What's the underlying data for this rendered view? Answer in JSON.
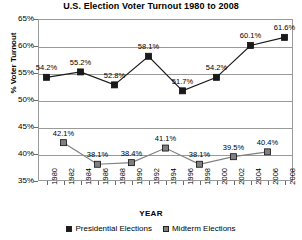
{
  "chart_data": {
    "type": "line",
    "title": "U.S. Election Voter Turnout 1980 to 2008",
    "xlabel": "YEAR",
    "ylabel": "% Voter Turnout",
    "ylim": [
      35,
      65
    ],
    "ytick_labels": [
      "65%",
      "60%",
      "55%",
      "50%",
      "45%",
      "40%",
      "35%"
    ],
    "ytick_values": [
      65,
      60,
      55,
      50,
      45,
      40,
      35
    ],
    "grid": "horizontal",
    "legend_position": "bottom-center",
    "x": [
      1980,
      1982,
      1984,
      1986,
      1988,
      1990,
      1992,
      1994,
      1996,
      1998,
      2000,
      2002,
      2004,
      2006,
      2008
    ],
    "xtick_labels": [
      "1980",
      "1982",
      "1984",
      "1986",
      "1988",
      "1990",
      "1992",
      "1994",
      "1996",
      "1998",
      "2000",
      "2002",
      "2004",
      "2006",
      "2008"
    ],
    "series": [
      {
        "name": "Presidential Elections",
        "color": "#1a1a1a",
        "marker": "square-filled-black",
        "points": [
          {
            "x": 1980,
            "y": 54.2,
            "label": "54.2%"
          },
          {
            "x": 1984,
            "y": 55.2,
            "label": "55.2%"
          },
          {
            "x": 1988,
            "y": 52.8,
            "label": "52.8%"
          },
          {
            "x": 1992,
            "y": 58.1,
            "label": "58.1%"
          },
          {
            "x": 1996,
            "y": 51.7,
            "label": "51.7%"
          },
          {
            "x": 2000,
            "y": 54.2,
            "label": "54.2%"
          },
          {
            "x": 2004,
            "y": 60.1,
            "label": "60.1%"
          },
          {
            "x": 2008,
            "y": 61.6,
            "label": "61.6%"
          }
        ]
      },
      {
        "name": "Midterm Elections",
        "color": "#808080",
        "marker": "square-filled-gray",
        "points": [
          {
            "x": 1982,
            "y": 42.1,
            "label": "42.1%"
          },
          {
            "x": 1986,
            "y": 38.1,
            "label": "38.1%"
          },
          {
            "x": 1990,
            "y": 38.4,
            "label": "38.4%"
          },
          {
            "x": 1994,
            "y": 41.1,
            "label": "41.1%"
          },
          {
            "x": 1998,
            "y": 38.1,
            "label": "38.1%"
          },
          {
            "x": 2002,
            "y": 39.5,
            "label": "39.5%"
          },
          {
            "x": 2006,
            "y": 40.4,
            "label": "40.4%"
          }
        ]
      }
    ],
    "legend": [
      {
        "label": "Presidential Elections",
        "color": "#1a1a1a"
      },
      {
        "label": "Midterm Elections",
        "color": "#808080"
      }
    ]
  }
}
